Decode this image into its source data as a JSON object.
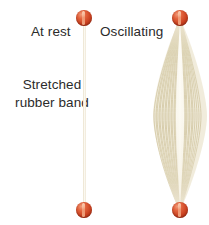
{
  "figure": {
    "width": 209,
    "height": 225,
    "background_color": "#ffffff"
  },
  "labels": {
    "at_rest": "At rest",
    "oscillating": "Oscillating",
    "stretched_rubber_band": "Stretched rubber band",
    "text_color": "#2b2b2b"
  },
  "rest_band": {
    "name": "at-rest rubber band",
    "color": "#f2ecdc",
    "top_y": 18,
    "bottom_y": 211,
    "center_x": 84,
    "thickness_px": 3
  },
  "oscillating_band": {
    "name": "oscillating rubber band blur envelope",
    "strand_color": "#d6cbab",
    "strand_color_light": "#f7f3e6",
    "highlight_color": "#fdfcf7",
    "center_x": 180,
    "top_y": 18,
    "bottom_y": 211,
    "max_half_width_px": 27,
    "widest_y": 115,
    "strand_count": 31
  },
  "beads": {
    "name": "rubber band end weights",
    "color_light": "#f09a78",
    "color_mid": "#e2623c",
    "color_dark": "#9e2d14",
    "highlight_color": "#ffe1c8",
    "diameter_px": 16,
    "positions": [
      {
        "id": "rest-top",
        "x": 84,
        "y": 18
      },
      {
        "id": "rest-bottom",
        "x": 84,
        "y": 210
      },
      {
        "id": "osc-top",
        "x": 180,
        "y": 18
      },
      {
        "id": "osc-bottom",
        "x": 180,
        "y": 210
      }
    ]
  }
}
